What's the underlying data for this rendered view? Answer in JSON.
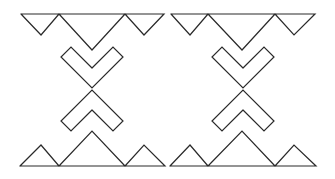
{
  "figure": {
    "width": 335,
    "height": 179,
    "background": "#ffffff",
    "stroke_color": "#2a2a2a",
    "stroke_width": 1.2
  },
  "motifs": [
    {
      "name": "left-motif",
      "top_band": "21,14 164,14 144,35 125,14 92,50 59,14 41,35 21,14",
      "upper_chevron": "92,68 71,47 61,57 92,88 123,57 113,47 92,68",
      "lower_chevron": "92,110 71,131 61,121 92,90 123,121 113,131 92,110",
      "bottom_band": "20,166 165,166 144,145 125,166 92,131 59,166 41,145 20,166"
    },
    {
      "name": "right-motif",
      "top_band": "171,14 315,14 294,35 275,14 242,50 208,14 190,35 171,14",
      "upper_chevron": "243,68 222,47 212,57 243,88 274,57 264,47 243,68",
      "lower_chevron": "243,110 222,131 212,121 243,90 274,121 264,131 243,110",
      "bottom_band": "170,166 316,166 294,145 275,166 242,131 208,166 190,145 170,166"
    }
  ]
}
